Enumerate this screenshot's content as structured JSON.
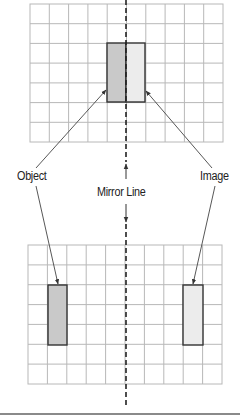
{
  "labels": {
    "object": "Object",
    "image": "Image",
    "mirror_line": "Mirror Line"
  },
  "colors": {
    "grid_line": "#b8b8b8",
    "outline": "#333333",
    "object_fill": "#c9c9c9",
    "image_fill": "#ececec",
    "text": "#222222",
    "arrow": "#444444",
    "bottom_rule": "#8a8a8a"
  },
  "top_grid": {
    "x": 30,
    "y": 4,
    "width": 193,
    "height": 138,
    "cols": 10,
    "rows": 7
  },
  "bottom_grid": {
    "x": 28,
    "y": 245,
    "width": 194,
    "height": 139,
    "cols": 10,
    "rows": 7
  },
  "top_object_rect": {
    "x": 107,
    "y": 43,
    "width": 19,
    "height": 59
  },
  "top_image_rect": {
    "x": 126,
    "y": 43,
    "width": 19,
    "height": 59
  },
  "bottom_object_rect": {
    "x": 48,
    "y": 285,
    "width": 19,
    "height": 60
  },
  "bottom_image_rect": {
    "x": 183,
    "y": 285,
    "width": 20,
    "height": 60
  },
  "mirror_x": 126
}
